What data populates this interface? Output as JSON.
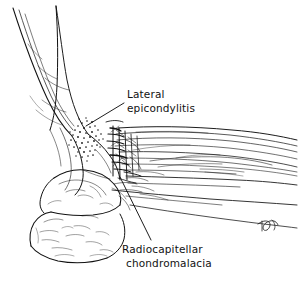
{
  "figure": {
    "background_color": "#ffffff",
    "ink_color": "#111111",
    "view": "lateral"
  },
  "labels": [
    {
      "id": "lateral-epicondylitis",
      "line1": "Lateral",
      "line2": "epicondylitis",
      "text_x": 127,
      "text_y": 98,
      "leader": "M124,103 L86,126"
    },
    {
      "id": "radiocapitellar-chondromalacia",
      "line1": "Radiocapitellar",
      "line2": "chondromalacia",
      "text_x": 122,
      "text_y": 253,
      "leader": "M151,240 L120,177"
    }
  ],
  "signature": {
    "initials": "TP",
    "x": 262,
    "y": 228
  },
  "regions": [
    {
      "id": "humerus-shaft",
      "name": "distal humerus shaft"
    },
    {
      "id": "lateral-epicondyle-stipple",
      "name": "stippled lateral epicondyle inflammation"
    },
    {
      "id": "annular-ligament",
      "name": "crosshatched annular ligament and radiocapitellar joint"
    },
    {
      "id": "olecranon",
      "name": "olecranon and proximal ulna with trabecular texture"
    },
    {
      "id": "extensor-mass",
      "name": "common extensor muscle mass of forearm"
    }
  ]
}
